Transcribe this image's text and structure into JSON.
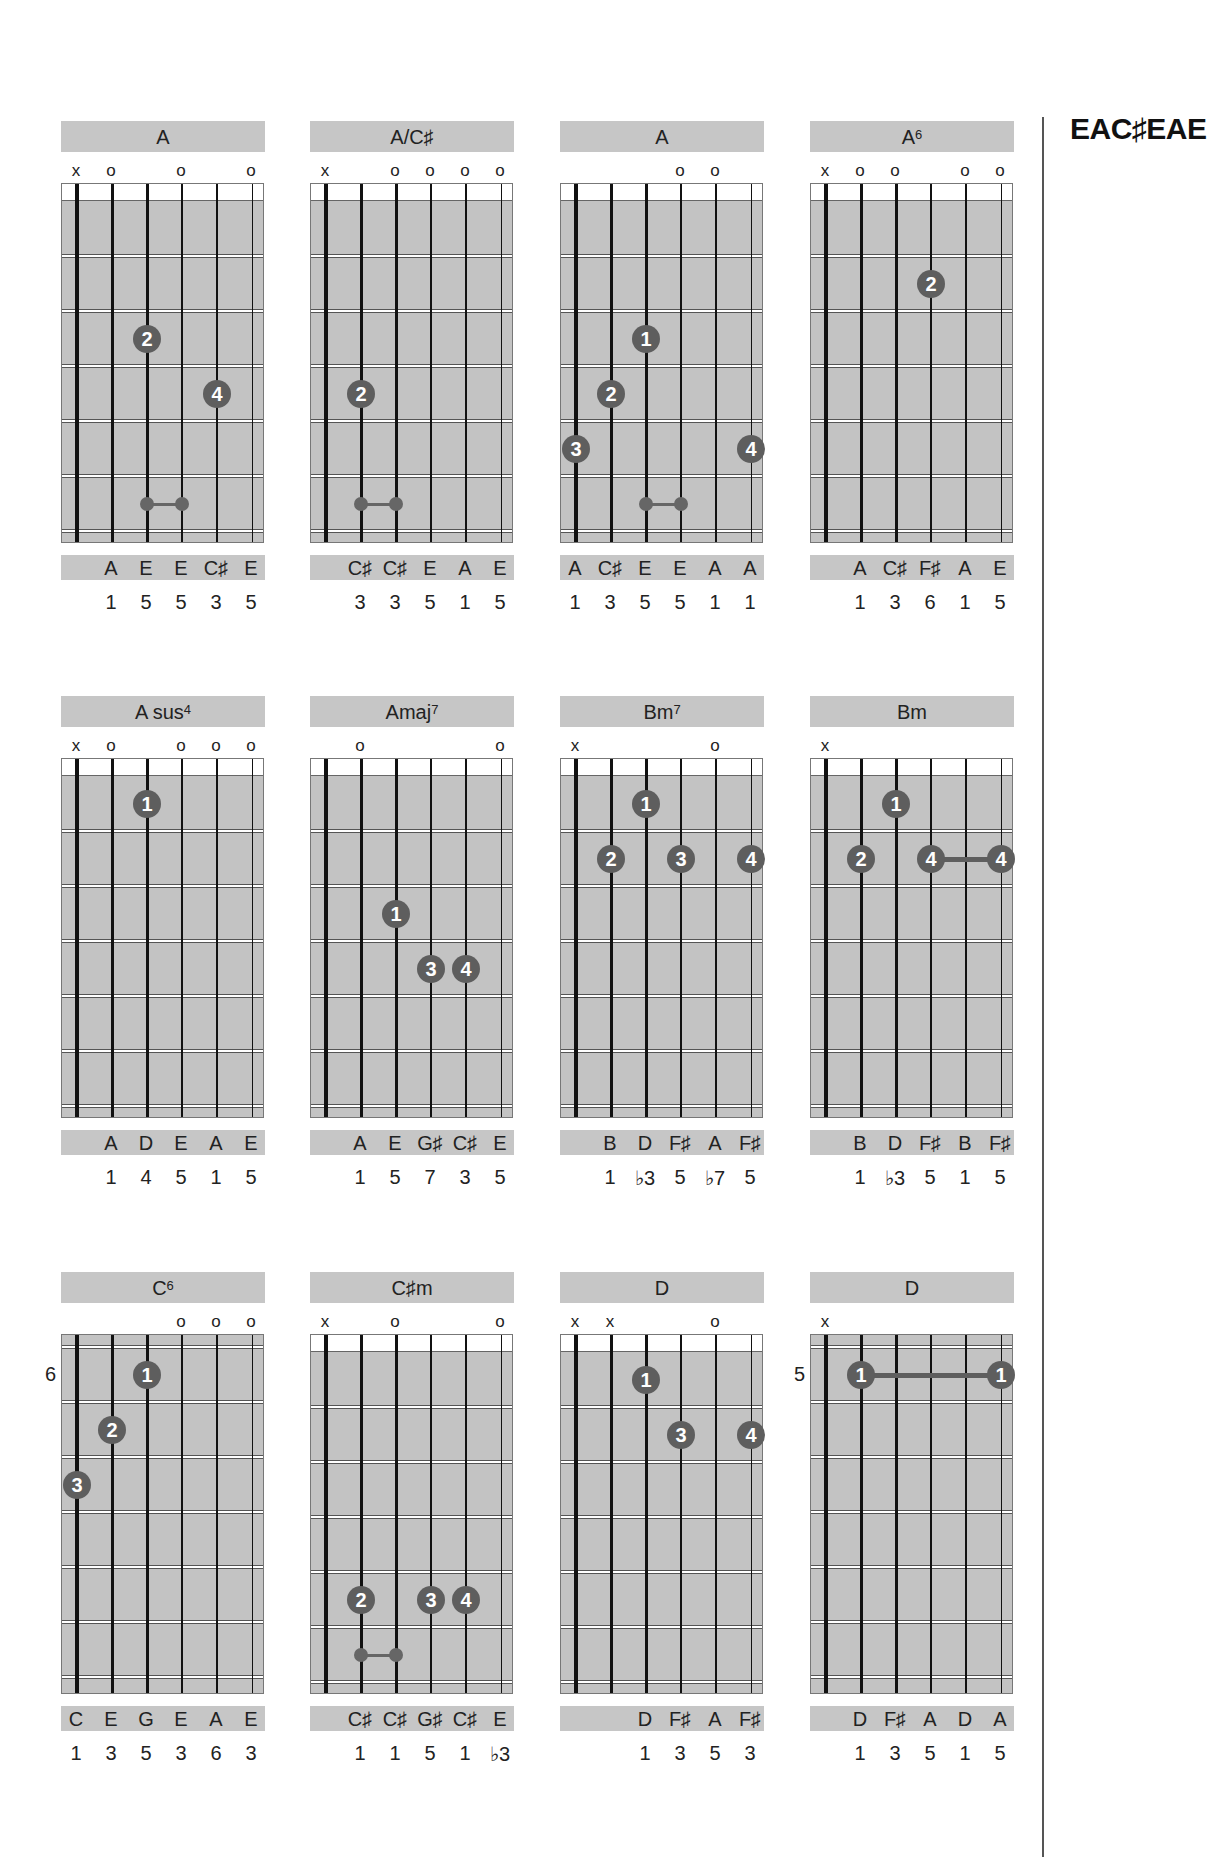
{
  "tuning": {
    "title": "EAC♯EAE"
  },
  "colors": {
    "panel_gray": "#c6c6c6",
    "finger_dot": "#5e5e5e",
    "string": "#111111"
  },
  "chords": [
    {
      "name": "A",
      "sup": "",
      "col": 0,
      "row": 0,
      "nut": true,
      "position": "",
      "markers": [
        "x",
        "o",
        "",
        "o",
        "",
        "o"
      ],
      "fingers": [
        {
          "finger": "2",
          "string": 2,
          "fret": 3
        },
        {
          "finger": "4",
          "string": 4,
          "fret": 4
        }
      ],
      "barres": [],
      "minibars": [
        {
          "from": 2,
          "to": 3,
          "fret": 6
        }
      ],
      "notes": [
        "",
        "A",
        "E",
        "E",
        "C♯",
        "E"
      ],
      "degrees": [
        "",
        "1",
        "5",
        "5",
        "3",
        "5"
      ]
    },
    {
      "name": "A/C♯",
      "sup": "",
      "col": 1,
      "row": 0,
      "nut": true,
      "position": "",
      "markers": [
        "x",
        "",
        "o",
        "o",
        "o",
        "o"
      ],
      "fingers": [
        {
          "finger": "2",
          "string": 1,
          "fret": 4
        }
      ],
      "barres": [],
      "minibars": [
        {
          "from": 1,
          "to": 2,
          "fret": 6
        }
      ],
      "notes": [
        "",
        "C♯",
        "C♯",
        "E",
        "A",
        "E"
      ],
      "degrees": [
        "",
        "3",
        "3",
        "5",
        "1",
        "5"
      ]
    },
    {
      "name": "A",
      "sup": "",
      "col": 2,
      "row": 0,
      "nut": true,
      "position": "",
      "markers": [
        "",
        "",
        "",
        "o",
        "o",
        ""
      ],
      "fingers": [
        {
          "finger": "1",
          "string": 2,
          "fret": 3
        },
        {
          "finger": "2",
          "string": 1,
          "fret": 4
        },
        {
          "finger": "3",
          "string": 0,
          "fret": 5
        },
        {
          "finger": "4",
          "string": 5,
          "fret": 5
        }
      ],
      "barres": [],
      "minibars": [
        {
          "from": 2,
          "to": 3,
          "fret": 6
        }
      ],
      "notes": [
        "A",
        "C♯",
        "E",
        "E",
        "A",
        "A"
      ],
      "degrees": [
        "1",
        "3",
        "5",
        "5",
        "1",
        "1"
      ]
    },
    {
      "name": "A",
      "sup": "6",
      "col": 3,
      "row": 0,
      "nut": true,
      "position": "",
      "markers": [
        "x",
        "o",
        "o",
        "",
        "o",
        "o"
      ],
      "fingers": [
        {
          "finger": "2",
          "string": 3,
          "fret": 2
        }
      ],
      "barres": [],
      "minibars": [],
      "notes": [
        "",
        "A",
        "C♯",
        "F♯",
        "A",
        "E"
      ],
      "degrees": [
        "",
        "1",
        "3",
        "6",
        "1",
        "5"
      ]
    },
    {
      "name": "A sus",
      "sup": "4",
      "col": 0,
      "row": 1,
      "nut": true,
      "position": "",
      "markers": [
        "x",
        "o",
        "",
        "o",
        "o",
        "o"
      ],
      "fingers": [
        {
          "finger": "1",
          "string": 2,
          "fret": 1
        }
      ],
      "barres": [],
      "minibars": [],
      "notes": [
        "",
        "A",
        "D",
        "E",
        "A",
        "E"
      ],
      "degrees": [
        "",
        "1",
        "4",
        "5",
        "1",
        "5"
      ]
    },
    {
      "name": "Amaj",
      "sup": "7",
      "col": 1,
      "row": 1,
      "nut": true,
      "position": "",
      "markers": [
        "",
        "o",
        "",
        "",
        "",
        "o"
      ],
      "fingers": [
        {
          "finger": "1",
          "string": 2,
          "fret": 3
        },
        {
          "finger": "3",
          "string": 3,
          "fret": 4
        },
        {
          "finger": "4",
          "string": 4,
          "fret": 4
        }
      ],
      "barres": [],
      "minibars": [],
      "notes": [
        "",
        "A",
        "E",
        "G♯",
        "C♯",
        "E"
      ],
      "degrees": [
        "",
        "1",
        "5",
        "7",
        "3",
        "5"
      ]
    },
    {
      "name": "Bm",
      "sup": "7",
      "col": 2,
      "row": 1,
      "nut": true,
      "position": "",
      "markers": [
        "x",
        "",
        "",
        "",
        "o",
        ""
      ],
      "fingers": [
        {
          "finger": "1",
          "string": 2,
          "fret": 1
        },
        {
          "finger": "2",
          "string": 1,
          "fret": 2
        },
        {
          "finger": "3",
          "string": 3,
          "fret": 2
        },
        {
          "finger": "4",
          "string": 5,
          "fret": 2
        }
      ],
      "barres": [],
      "minibars": [],
      "notes": [
        "",
        "B",
        "D",
        "F♯",
        "A",
        "F♯"
      ],
      "degrees": [
        "",
        "1",
        "♭3",
        "5",
        "♭7",
        "5"
      ]
    },
    {
      "name": "Bm",
      "sup": "",
      "col": 3,
      "row": 1,
      "nut": true,
      "position": "",
      "markers": [
        "x",
        "",
        "",
        "",
        "",
        ""
      ],
      "fingers": [
        {
          "finger": "1",
          "string": 2,
          "fret": 1
        },
        {
          "finger": "2",
          "string": 1,
          "fret": 2
        },
        {
          "finger": "4",
          "string": 3,
          "fret": 2
        },
        {
          "finger": "4",
          "string": 5,
          "fret": 2
        }
      ],
      "barres": [
        {
          "from": 3,
          "to": 5,
          "fret": 2
        }
      ],
      "minibars": [],
      "notes": [
        "",
        "B",
        "D",
        "F♯",
        "B",
        "F♯"
      ],
      "degrees": [
        "",
        "1",
        "♭3",
        "5",
        "1",
        "5"
      ]
    },
    {
      "name": "C",
      "sup": "6",
      "col": 0,
      "row": 2,
      "nut": false,
      "position": "6",
      "markers": [
        "",
        "",
        "",
        "o",
        "o",
        "o"
      ],
      "fingers": [
        {
          "finger": "1",
          "string": 2,
          "fret": 1
        },
        {
          "finger": "2",
          "string": 1,
          "fret": 2
        },
        {
          "finger": "3",
          "string": 0,
          "fret": 3
        }
      ],
      "barres": [],
      "minibars": [],
      "notes": [
        "C",
        "E",
        "G",
        "E",
        "A",
        "E"
      ],
      "degrees": [
        "1",
        "3",
        "5",
        "3",
        "6",
        "3"
      ]
    },
    {
      "name": "C♯m",
      "sup": "",
      "col": 1,
      "row": 2,
      "nut": true,
      "position": "",
      "markers": [
        "x",
        "",
        "o",
        "",
        "",
        "o"
      ],
      "fingers": [
        {
          "finger": "2",
          "string": 1,
          "fret": 5
        },
        {
          "finger": "3",
          "string": 3,
          "fret": 5
        },
        {
          "finger": "4",
          "string": 4,
          "fret": 5
        }
      ],
      "barres": [],
      "minibars": [
        {
          "from": 1,
          "to": 2,
          "fret": 6
        }
      ],
      "notes": [
        "",
        "C♯",
        "C♯",
        "G♯",
        "C♯",
        "E"
      ],
      "degrees": [
        "",
        "1",
        "1",
        "5",
        "1",
        "♭3"
      ]
    },
    {
      "name": "D",
      "sup": "",
      "col": 2,
      "row": 2,
      "nut": true,
      "position": "",
      "markers": [
        "x",
        "x",
        "",
        "",
        "o",
        ""
      ],
      "fingers": [
        {
          "finger": "1",
          "string": 2,
          "fret": 1
        },
        {
          "finger": "3",
          "string": 3,
          "fret": 2
        },
        {
          "finger": "4",
          "string": 5,
          "fret": 2
        }
      ],
      "barres": [],
      "minibars": [],
      "notes": [
        "",
        "",
        "D",
        "F♯",
        "A",
        "F♯"
      ],
      "degrees": [
        "",
        "",
        "1",
        "3",
        "5",
        "3"
      ]
    },
    {
      "name": "D",
      "sup": "",
      "col": 3,
      "row": 2,
      "nut": false,
      "position": "5",
      "markers": [
        "x",
        "",
        "",
        "",
        "",
        ""
      ],
      "fingers": [
        {
          "finger": "1",
          "string": 1,
          "fret": 1
        },
        {
          "finger": "1",
          "string": 5,
          "fret": 1
        }
      ],
      "barres": [
        {
          "from": 1,
          "to": 5,
          "fret": 1
        }
      ],
      "minibars": [],
      "notes": [
        "",
        "D",
        "F♯",
        "A",
        "D",
        "A"
      ],
      "degrees": [
        "",
        "1",
        "3",
        "5",
        "1",
        "5"
      ]
    }
  ]
}
